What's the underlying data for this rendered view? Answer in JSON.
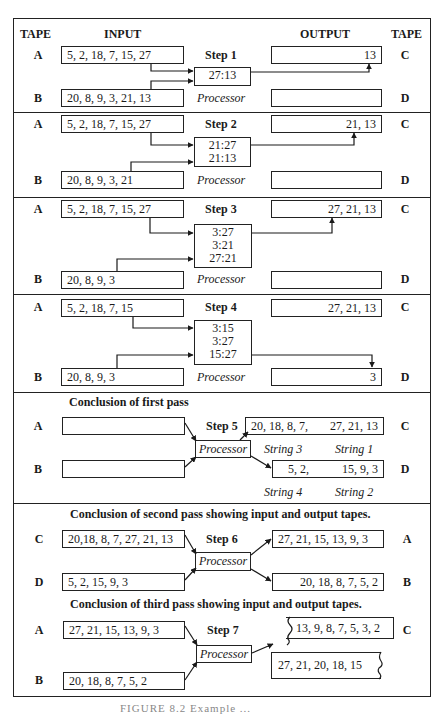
{
  "header": {
    "tape_left": "TAPE",
    "input": "INPUT",
    "output": "OUTPUT",
    "tape_right": "TAPE"
  },
  "processor_label": "Processor",
  "steps": [
    {
      "step": "Step 1",
      "top_tape": "A",
      "bottom_tape": "B",
      "out_top_tape": "C",
      "out_bottom_tape": "D",
      "input_top": "5, 2, 18, 7, 15, 27",
      "input_bottom": "20, 8, 9, 3, 21, 13",
      "processor_lines": [
        "27:13"
      ],
      "output_top": "13",
      "output_bottom": ""
    },
    {
      "step": "Step 2",
      "top_tape": "A",
      "bottom_tape": "B",
      "out_top_tape": "C",
      "out_bottom_tape": "D",
      "input_top": "5, 2, 18, 7, 15, 27",
      "input_bottom": "20, 8, 9, 3, 21",
      "processor_lines": [
        "21:27",
        "21:13"
      ],
      "output_top": "21, 13",
      "output_bottom": ""
    },
    {
      "step": "Step 3",
      "top_tape": "A",
      "bottom_tape": "B",
      "out_top_tape": "C",
      "out_bottom_tape": "D",
      "input_top": "5, 2, 18, 7, 15, 27",
      "input_bottom": "20, 8, 9, 3",
      "processor_lines": [
        "3:27",
        "3:21",
        "27:21"
      ],
      "output_top": "27, 21, 13",
      "output_bottom": ""
    },
    {
      "step": "Step 4",
      "top_tape": "A",
      "bottom_tape": "B",
      "out_top_tape": "C",
      "out_bottom_tape": "D",
      "input_top": "5, 2, 18, 7, 15",
      "input_bottom": "20, 8, 9, 3",
      "processor_lines": [
        "3:15",
        "3:27",
        "15:27"
      ],
      "output_top": "27, 21, 13",
      "output_bottom": "3"
    },
    {
      "caption": "Conclusion of first pass",
      "step": "Step 5",
      "top_tape": "A",
      "bottom_tape": "B",
      "out_top_tape": "C",
      "out_bottom_tape": "D",
      "input_top": "",
      "input_bottom": "",
      "output_top_left": "20, 18, 8, 7,",
      "output_top_right": "27, 21, 13",
      "output_bottom_left": "5, 2,",
      "output_bottom_right": "15, 9, 3",
      "string_labels": {
        "top_left": "String 3",
        "top_right": "String 1",
        "bottom_left": "String 4",
        "bottom_right": "String 2"
      }
    },
    {
      "caption": "Conclusion of second pass showing input and output tapes.",
      "step": "Step 6",
      "top_tape": "C",
      "bottom_tape": "D",
      "out_top_tape": "A",
      "out_bottom_tape": "B",
      "input_top": "20,18, 8, 7, 27, 21, 13",
      "input_bottom": "5, 2, 15, 9, 3",
      "output_top": "27, 21, 15, 13, 9, 3",
      "output_bottom": "20, 18, 8, 7, 5, 2"
    },
    {
      "caption": "Conclusion of third pass showing input and output tapes.",
      "step": "Step 7",
      "top_tape": "A",
      "bottom_tape": "B",
      "out_top_tape": "C",
      "input_top": "27, 21, 15, 13, 9, 3",
      "input_bottom": "20, 18, 8, 7, 5, 2",
      "output_top": "13, 9, 8, 7, 5, 3, 2",
      "output_continued": "27, 21, 20, 18, 15"
    }
  ],
  "figure_caption": "FIGURE 8.2  Example ..."
}
